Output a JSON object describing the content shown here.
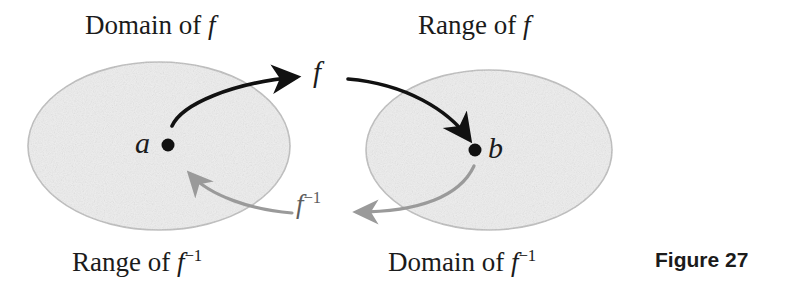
{
  "figure": {
    "caption": "Figure 27",
    "canvas": {
      "width": 794,
      "height": 292,
      "background": "#ffffff"
    }
  },
  "sets": {
    "left": {
      "fill": "#eeeeee",
      "stroke": "#b8b8b8",
      "top_label": "Domain of f",
      "bottom_label_text": "Range of f",
      "bottom_label_sup": "−1",
      "cx": 159,
      "cy": 146,
      "rx": 131,
      "ry": 84
    },
    "right": {
      "fill": "#eeeeee",
      "stroke": "#b8b8b8",
      "top_label": "Range of f",
      "bottom_label_text": "Domain of f",
      "bottom_label_sup": "−1",
      "cx": 489,
      "cy": 150,
      "rx": 123,
      "ry": 80
    }
  },
  "points": [
    {
      "name": "a",
      "label": "a",
      "x": 168,
      "y": 145,
      "color": "#111111",
      "radius": 6
    },
    {
      "name": "b",
      "label": "b",
      "x": 475,
      "y": 150,
      "color": "#111111",
      "radius": 6
    }
  ],
  "arrows": {
    "forward": {
      "label": "f",
      "color": "#111111",
      "description": "black curved arrow from a to b labeled f"
    },
    "inverse": {
      "label_text": "f",
      "label_sup": "−1",
      "color": "#9a9a9a",
      "description": "gray curved arrow from b back to a labeled f inverse"
    }
  },
  "text": {
    "domain_of_f": "Domain of f",
    "range_of_f": "Range of f",
    "range_of": "Range of ",
    "domain_of": "Domain of ",
    "f_letter": "f",
    "inverse_sup": "−1"
  }
}
